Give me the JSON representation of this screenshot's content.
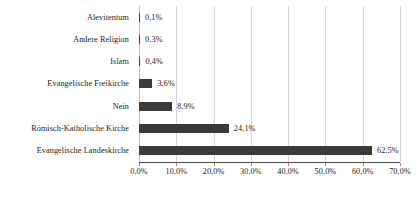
{
  "chart_data": {
    "type": "bar",
    "orientation": "horizontal",
    "title": "",
    "subtitle": "",
    "xlabel": "",
    "ylabel": "",
    "categories": [
      "Alevitentum",
      "Andere Religion",
      "Islam",
      "Evangelische Freikirche",
      "Nein",
      "Römisch-Katholische Kirche",
      "Evangelische Landeskirche"
    ],
    "values": [
      0.1,
      0.3,
      0.4,
      3.6,
      8.9,
      24.1,
      62.5
    ],
    "value_labels": [
      "0,1%",
      "0,3%",
      "0,4%",
      "3,6%",
      "8,9%",
      "24,1%",
      "62,5%"
    ],
    "xlim": [
      0,
      70
    ],
    "xticks": [
      0,
      10,
      20,
      30,
      40,
      50,
      60,
      70
    ],
    "xtick_labels": [
      "0,0%",
      "10,0%",
      "20,0%",
      "30,0%",
      "40,0%",
      "50,0%",
      "60,0%",
      "70,0%"
    ],
    "grid": true,
    "grid_axis": "x",
    "legend": false,
    "legend_position": "none",
    "bar_color": "#3a3a3a",
    "grid_color": "#d4d4d4",
    "axis_color": "#4a4a4a",
    "background_color": "#ffffff",
    "text_color": "#222222"
  }
}
